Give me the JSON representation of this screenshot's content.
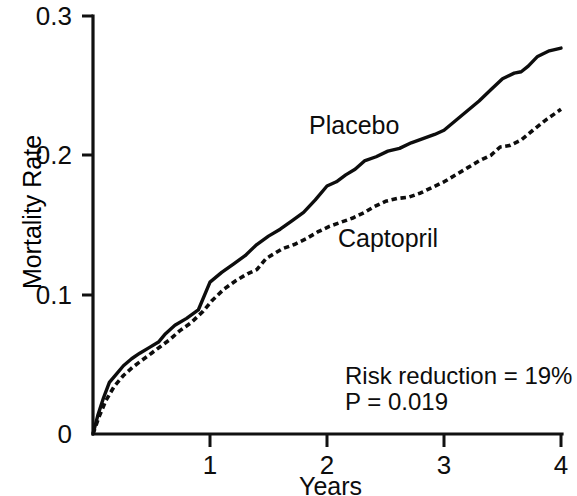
{
  "chart_data": {
    "type": "line",
    "title": "",
    "subtitle": "",
    "xlabel": "Years",
    "ylabel": "Mortality Rate",
    "xlim": [
      0,
      4
    ],
    "ylim": [
      0,
      0.3
    ],
    "xticks": [
      "1",
      "2",
      "3",
      "4"
    ],
    "xtick_values": [
      1,
      2,
      3,
      4
    ],
    "yticks": [
      "0",
      "0.1",
      "0.2",
      "0.3"
    ],
    "ytick_values": [
      0,
      0.1,
      0.2,
      0.3
    ],
    "grid": false,
    "legend_position": "inline-annotations",
    "series": [
      {
        "name": "Placebo",
        "style": "solid",
        "x": [
          0.0,
          0.04,
          0.09,
          0.14,
          0.2,
          0.26,
          0.33,
          0.4,
          0.48,
          0.56,
          0.62,
          0.7,
          0.8,
          0.9,
          1.0,
          1.1,
          1.2,
          1.3,
          1.4,
          1.5,
          1.6,
          1.7,
          1.8,
          1.9,
          2.0,
          2.08,
          2.16,
          2.24,
          2.32,
          2.42,
          2.52,
          2.62,
          2.72,
          2.82,
          2.92,
          3.0,
          3.1,
          3.2,
          3.3,
          3.4,
          3.5,
          3.6,
          3.66,
          3.72,
          3.8,
          3.9,
          4.0
        ],
        "y": [
          0.0,
          0.013,
          0.026,
          0.037,
          0.043,
          0.049,
          0.054,
          0.058,
          0.062,
          0.066,
          0.072,
          0.078,
          0.083,
          0.089,
          0.109,
          0.116,
          0.122,
          0.128,
          0.136,
          0.142,
          0.147,
          0.153,
          0.159,
          0.168,
          0.178,
          0.181,
          0.186,
          0.19,
          0.196,
          0.199,
          0.203,
          0.205,
          0.209,
          0.212,
          0.215,
          0.218,
          0.225,
          0.232,
          0.239,
          0.247,
          0.255,
          0.259,
          0.26,
          0.264,
          0.271,
          0.275,
          0.277
        ]
      },
      {
        "name": "Captopril",
        "style": "dashed",
        "x": [
          0.0,
          0.05,
          0.11,
          0.18,
          0.26,
          0.34,
          0.42,
          0.5,
          0.58,
          0.66,
          0.74,
          0.84,
          0.94,
          1.02,
          1.12,
          1.22,
          1.32,
          1.4,
          1.48,
          1.54,
          1.62,
          1.72,
          1.82,
          1.92,
          2.02,
          2.12,
          2.22,
          2.32,
          2.4,
          2.5,
          2.6,
          2.7,
          2.8,
          2.9,
          3.0,
          3.1,
          3.2,
          3.3,
          3.4,
          3.48,
          3.56,
          3.66,
          3.76,
          3.88,
          4.0
        ],
        "y": [
          0.0,
          0.012,
          0.024,
          0.034,
          0.042,
          0.048,
          0.053,
          0.058,
          0.063,
          0.068,
          0.074,
          0.08,
          0.088,
          0.096,
          0.104,
          0.11,
          0.115,
          0.118,
          0.126,
          0.129,
          0.133,
          0.136,
          0.14,
          0.145,
          0.149,
          0.152,
          0.155,
          0.159,
          0.163,
          0.167,
          0.169,
          0.17,
          0.173,
          0.177,
          0.181,
          0.186,
          0.191,
          0.196,
          0.2,
          0.206,
          0.207,
          0.211,
          0.218,
          0.226,
          0.233
        ]
      }
    ],
    "annotations": [
      {
        "id": "placebo-curve-label",
        "text": "Placebo",
        "x": 1.55,
        "y": 0.214
      },
      {
        "id": "captopril-curve-label",
        "text": "Captopril",
        "x": 2.05,
        "y": 0.14
      },
      {
        "id": "risk-reduction-note",
        "text": "Risk reduction = 19%",
        "x": 2.17,
        "y": 0.0435
      },
      {
        "id": "p-value-note",
        "text": "P = 0.019",
        "x": 2.17,
        "y": 0.0275
      }
    ]
  },
  "axes": {
    "y_tick_labels": [
      "0.3",
      "0.2",
      "0.1",
      "0"
    ],
    "x_tick_labels": [
      "1",
      "2",
      "3",
      "4"
    ],
    "x_axis_title": "Years",
    "y_axis_title": "Mortality Rate"
  },
  "labels": {
    "placebo": "Placebo",
    "captopril": "Captopril",
    "risk_reduction": "Risk reduction = 19%",
    "p_value": "P = 0.019"
  },
  "colors": {
    "ink": "#0d0d0d",
    "background": "#ffffff"
  }
}
